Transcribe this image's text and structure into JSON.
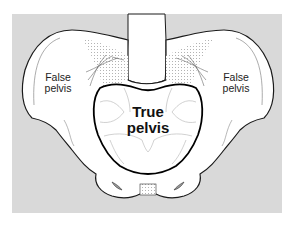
{
  "diagram": {
    "type": "anatomical illustration",
    "colors": {
      "background_panel": "#d9d9d9",
      "bone_fill": "#ffffff",
      "outline": "#1a1a1a",
      "inner_lines": "#b8b8b8",
      "true_pelvis_outline": "#000000"
    },
    "labels": {
      "false_pelvis_left": {
        "line1": "False",
        "line2": "pelvis"
      },
      "false_pelvis_right": {
        "line1": "False",
        "line2": "pelvis"
      },
      "true_pelvis": {
        "line1": "True",
        "line2": "pelvis"
      }
    }
  }
}
